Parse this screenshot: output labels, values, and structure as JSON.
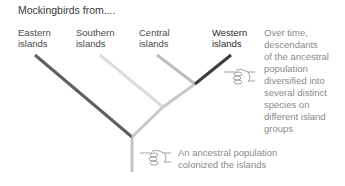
{
  "title": "Mockingbirds from....",
  "groups": [
    {
      "line1": "Eastern",
      "line2": "islands",
      "color": "#5f5f5f"
    },
    {
      "line1": "Southern",
      "line2": "islands",
      "color": "#dcdcdc"
    },
    {
      "line1": "Central",
      "line2": "islands",
      "color": "#bdbdbd"
    },
    {
      "line1": "Western",
      "line2": "islands",
      "color": "#3c3c3c"
    }
  ],
  "annotations": {
    "diversification": [
      "Over time,",
      "descendants",
      "of the ancestral",
      "population",
      "diversified into",
      "several distinct",
      "species on",
      "different island",
      "groups"
    ],
    "colonization": [
      "An ancestral population",
      "colonized the islands"
    ]
  },
  "icons": {
    "pointer": "pointing-hand-icon"
  },
  "colors": {
    "trunk": "#c4c4c4",
    "inner_branch": "#c8c8c8",
    "text": "#4a4a4a",
    "note_text": "#8a8a8a"
  }
}
